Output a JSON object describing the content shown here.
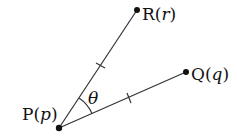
{
  "diagram": {
    "points": [
      {
        "id": "P",
        "label": "P",
        "arg": "p",
        "x": 59,
        "y": 128
      },
      {
        "id": "R",
        "label": "R",
        "arg": "r",
        "x": 137,
        "y": 10
      },
      {
        "id": "Q",
        "label": "Q",
        "arg": "q",
        "x": 186,
        "y": 72
      }
    ],
    "segments": [
      {
        "from": "P",
        "to": "R",
        "tick": true
      },
      {
        "from": "P",
        "to": "Q",
        "tick": true
      }
    ],
    "angle": {
      "vertex": "P",
      "label": "θ"
    },
    "colors": {
      "stroke": "#222222",
      "text": "#111111"
    }
  }
}
